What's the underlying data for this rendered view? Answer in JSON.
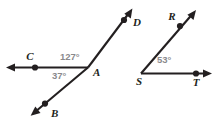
{
  "figure": {
    "background_color": "#ffffff",
    "line_color": "#231f20",
    "label_color": "#231f20",
    "angle_label_color": "#8a8a8d",
    "width": 221,
    "height": 124
  },
  "left_figure": {
    "name": "angle-at-A",
    "vertex_label": "A",
    "point_labels": {
      "c": "C",
      "b": "B",
      "d": "D",
      "a": "A"
    },
    "angles": [
      {
        "id": "cad",
        "value": "127°",
        "measure": 127,
        "rays": [
          "AC",
          "AD"
        ]
      },
      {
        "id": "cab",
        "value": "37°",
        "measure": 37,
        "rays": [
          "AC",
          "AB"
        ]
      }
    ]
  },
  "right_figure": {
    "name": "angle-at-S",
    "vertex_label": "S",
    "point_labels": {
      "r": "R",
      "s": "S",
      "t": "T"
    },
    "angles": [
      {
        "id": "rst",
        "value": "53°",
        "measure": 53,
        "rays": [
          "SR",
          "ST"
        ]
      }
    ]
  }
}
